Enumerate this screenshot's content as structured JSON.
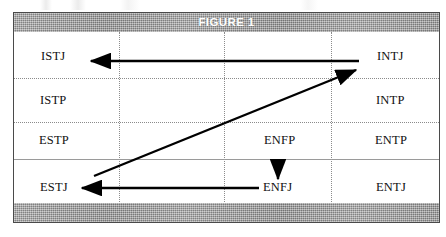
{
  "figure": {
    "title": "FIGURE 1",
    "header_band_color": "#9b9b9b",
    "title_color": "#ffffff",
    "border_color": "#4a4a4a",
    "grid_line_color": "#8c8c8c",
    "arrow_color": "#000000"
  },
  "cells": {
    "istj": "ISTJ",
    "istp": "ISTP",
    "estp": "ESTP",
    "estj": "ESTJ",
    "intj": "INTJ",
    "intp": "INTP",
    "entp": "ENTP",
    "entj": "ENTJ",
    "enfp": "ENFP",
    "enfj": "ENFJ"
  },
  "arrows": [
    {
      "name": "intj-to-istj",
      "from": "INTJ",
      "to": "ISTJ",
      "direction": "right-to-left",
      "style": "horizontal"
    },
    {
      "name": "estj-to-intj",
      "from": "ESTJ",
      "to": "INTJ",
      "direction": "lower-left-to-upper-right",
      "style": "diagonal"
    },
    {
      "name": "enfp-to-enfj",
      "from": "ENFP",
      "to": "ENFJ",
      "direction": "top-to-bottom",
      "style": "vertical"
    },
    {
      "name": "enfj-to-estj",
      "from": "ENFJ",
      "to": "ESTJ",
      "direction": "right-to-left",
      "style": "horizontal"
    }
  ]
}
